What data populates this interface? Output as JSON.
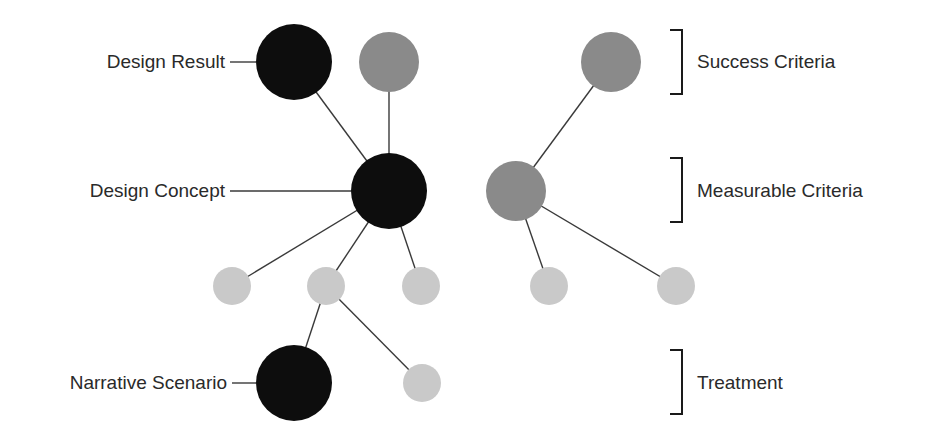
{
  "labels": {
    "left": [
      {
        "text": "Design Result",
        "y": 62
      },
      {
        "text": "Design Concept",
        "y": 191
      },
      {
        "text": "Narrative Scenario",
        "y": 383
      }
    ],
    "right": [
      {
        "text": "Success Criteria",
        "y": 62
      },
      {
        "text": "Measurable Criteria",
        "y": 191
      },
      {
        "text": "Treatment",
        "y": 383
      }
    ]
  },
  "colors": {
    "dark": "#0d0d0d",
    "medium": "#8a8a8a",
    "light": "#c9c9c9",
    "line": "#3a3a3a",
    "text": "#2a2a2a"
  },
  "nodes": [
    {
      "id": "design-result",
      "x": 294,
      "y": 62,
      "r": 38,
      "tone": "dark"
    },
    {
      "id": "top-gray",
      "x": 389,
      "y": 62,
      "r": 30,
      "tone": "medium"
    },
    {
      "id": "design-concept",
      "x": 389,
      "y": 191,
      "r": 38,
      "tone": "dark"
    },
    {
      "id": "light-1",
      "x": 232,
      "y": 286,
      "r": 19,
      "tone": "light"
    },
    {
      "id": "light-2",
      "x": 326,
      "y": 286,
      "r": 19,
      "tone": "light"
    },
    {
      "id": "light-3",
      "x": 421,
      "y": 286,
      "r": 19,
      "tone": "light"
    },
    {
      "id": "narrative-scenario",
      "x": 294,
      "y": 383,
      "r": 38,
      "tone": "dark"
    },
    {
      "id": "light-4",
      "x": 422,
      "y": 383,
      "r": 19,
      "tone": "light"
    },
    {
      "id": "success-criteria-node",
      "x": 611,
      "y": 62,
      "r": 30,
      "tone": "medium"
    },
    {
      "id": "measurable-criteria-node",
      "x": 516,
      "y": 191,
      "r": 30,
      "tone": "medium"
    },
    {
      "id": "light-5",
      "x": 549,
      "y": 286,
      "r": 19,
      "tone": "light"
    },
    {
      "id": "light-6",
      "x": 676,
      "y": 286,
      "r": 19,
      "tone": "light"
    }
  ],
  "edges": [
    [
      "design-result",
      "design-concept"
    ],
    [
      "top-gray",
      "design-concept"
    ],
    [
      "design-concept",
      "light-1"
    ],
    [
      "design-concept",
      "light-2"
    ],
    [
      "design-concept",
      "light-3"
    ],
    [
      "light-2",
      "narrative-scenario"
    ],
    [
      "light-2",
      "light-4"
    ],
    [
      "success-criteria-node",
      "measurable-criteria-node"
    ],
    [
      "measurable-criteria-node",
      "light-5"
    ],
    [
      "measurable-criteria-node",
      "light-6"
    ]
  ],
  "leaders": [
    {
      "x1": 230,
      "x2": 256,
      "y": 62
    },
    {
      "x1": 230,
      "x2": 351,
      "y": 191
    },
    {
      "x1": 232,
      "x2": 256,
      "y": 383
    }
  ],
  "brackets": [
    {
      "x": 682,
      "y1": 30,
      "y2": 94
    },
    {
      "x": 682,
      "y1": 158,
      "y2": 222
    },
    {
      "x": 682,
      "y1": 350,
      "y2": 414
    }
  ]
}
